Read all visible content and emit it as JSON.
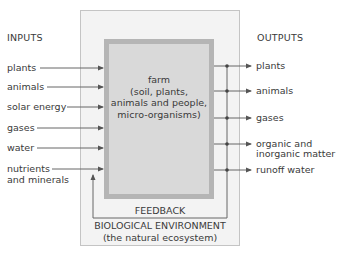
{
  "headers": {
    "inputs": "INPUTS",
    "outputs": "OUTPUTS"
  },
  "inputs": [
    {
      "label": "plants",
      "y": 68
    },
    {
      "label": "animals",
      "y": 87
    },
    {
      "label": "solar energy",
      "y": 107
    },
    {
      "label": "gases",
      "y": 128
    },
    {
      "label": "water",
      "y": 148
    },
    {
      "label": "nutrients",
      "label2": "and minerals",
      "y": 169
    }
  ],
  "farm": {
    "title": "farm",
    "line1": "(soil, plants,",
    "line2": "animals and people,",
    "line3": "micro-organisms)"
  },
  "outputs": [
    {
      "label": "plants",
      "y": 66
    },
    {
      "label": "animals",
      "y": 91
    },
    {
      "label": "gases",
      "y": 118
    },
    {
      "label": "organic and",
      "label2": "inorganic matter",
      "y": 144
    },
    {
      "label": "runoff water",
      "y": 170
    }
  ],
  "feedback": "FEEDBACK",
  "environment": {
    "title": "BIOLOGICAL ENVIRONMENT",
    "subtitle": "(the natural ecosystem)"
  },
  "colors": {
    "outer_fill": "#f3f3f3",
    "outer_border": "#c4c4c4",
    "inner_fill": "#d9d9d9",
    "inner_border": "#b5b5b5",
    "line": "#555555"
  }
}
